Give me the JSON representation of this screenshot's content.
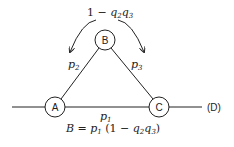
{
  "diagram": {
    "top_label": {
      "prefix": "1 − ",
      "q2": "q",
      "q2_sub": "2",
      "q3": "q",
      "q3_sub": "3"
    },
    "nodes": [
      {
        "id": "A",
        "label": "A"
      },
      {
        "id": "B",
        "label": "B"
      },
      {
        "id": "C",
        "label": "C"
      }
    ],
    "edges": [
      {
        "from": "A",
        "to": "B",
        "label": "p",
        "sub": "2"
      },
      {
        "from": "B",
        "to": "C",
        "label": "p",
        "sub": "3"
      },
      {
        "from": "A",
        "to": "C",
        "label": "p",
        "sub": "1"
      }
    ],
    "end_label": "(D)",
    "formula": {
      "lhs": "B = ",
      "p": "p",
      "p_sub": "1",
      "mid": " (1 − ",
      "q2": "q",
      "q2_sub": "2",
      "q3": "q",
      "q3_sub": "3",
      "end": ")"
    },
    "colors": {
      "stroke": "#222222",
      "background": "#ffffff"
    }
  }
}
